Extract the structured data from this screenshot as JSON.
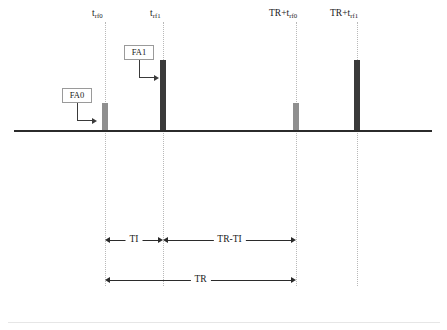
{
  "figure": {
    "type": "pulse-sequence-timing-diagram",
    "baseline": {
      "x1": 14,
      "x2": 432,
      "y": 130
    },
    "bottom_rule": {
      "x1": 8,
      "x2": 440,
      "y": 322
    },
    "guide_span": {
      "y1": 22,
      "y2": 286
    }
  },
  "time_points": [
    {
      "id": "trf0",
      "label_main": "t",
      "label_sub": "rf0",
      "x": 105,
      "label_x": 92,
      "label_y": 9
    },
    {
      "id": "trf1",
      "label_main": "t",
      "label_sub": "rf1",
      "x": 163,
      "label_x": 150,
      "label_y": 9
    },
    {
      "id": "tr_trf0",
      "label_main": "TR+t",
      "label_sub": "rf0",
      "x": 296,
      "label_x": 269,
      "label_y": 9
    },
    {
      "id": "tr_trf1",
      "label_main": "TR+t",
      "label_sub": "rf1",
      "x": 357,
      "label_x": 330,
      "label_y": 9
    }
  ],
  "pulses": [
    {
      "id": "rf0-first",
      "flip_angle_ref": "FA0",
      "x": 102,
      "width": 6,
      "top": 103,
      "height": 27,
      "style": "short"
    },
    {
      "id": "rf1-first",
      "flip_angle_ref": "FA1",
      "x": 160,
      "width": 6,
      "top": 60,
      "height": 70,
      "style": "tall"
    },
    {
      "id": "rf0-second",
      "flip_angle_ref": "FA0",
      "x": 293,
      "width": 6,
      "top": 103,
      "height": 27,
      "style": "short"
    },
    {
      "id": "rf1-second",
      "flip_angle_ref": "FA1",
      "x": 354,
      "width": 6,
      "top": 60,
      "height": 70,
      "style": "tall"
    }
  ],
  "callouts": [
    {
      "id": "fa0",
      "label": "FA0",
      "box": {
        "x": 62,
        "y": 88,
        "w": 30,
        "h": 15
      },
      "elbow": {
        "x": 77,
        "y": 103,
        "v_height": 17,
        "h_width": 20
      }
    },
    {
      "id": "fa1",
      "label": "FA1",
      "box": {
        "x": 124,
        "y": 45,
        "w": 30,
        "h": 15
      },
      "elbow": {
        "x": 139,
        "y": 60,
        "v_height": 17,
        "h_width": 20
      }
    }
  ],
  "measurements": [
    {
      "id": "ti",
      "label": "TI",
      "x1": 105,
      "x2": 163,
      "y": 235
    },
    {
      "id": "tr-ti",
      "label": "TR-TI",
      "x1": 163,
      "x2": 296,
      "y": 235
    },
    {
      "id": "tr",
      "label": "TR",
      "x1": 105,
      "x2": 296,
      "y": 275
    }
  ],
  "colors": {
    "baseline": "#2b2b2b",
    "pulse_short": "#8f8f8f",
    "pulse_tall": "#3a3a3a",
    "guide": "#b9b9b9",
    "callout_border": "#9a9a9a",
    "text": "#1a1a1a",
    "background": "#ffffff"
  }
}
